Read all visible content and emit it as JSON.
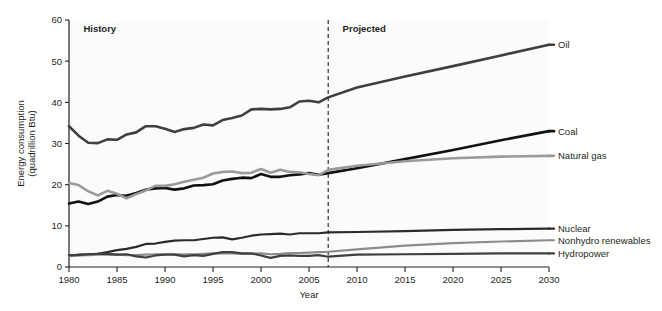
{
  "chart_data": {
    "type": "line",
    "title": "",
    "xlabel": "Year",
    "ylabel": "Energy consumption (quadrillion Btu)",
    "ylabel_line1": "Energy consumption",
    "ylabel_line2": "(quadrillion Btu)",
    "xlim": [
      1980,
      2030
    ],
    "ylim": [
      0,
      60
    ],
    "grid": false,
    "legend_position": "right-inline",
    "xticks": [
      1980,
      1985,
      1990,
      1995,
      2000,
      2005,
      2010,
      2015,
      2020,
      2025,
      2030
    ],
    "xtick_labels": [
      "1980",
      "1985",
      "1990",
      "1995",
      "2000",
      "2005",
      "2010",
      "2015",
      "2020",
      "2025",
      "2030"
    ],
    "yticks": [
      0,
      10,
      20,
      30,
      40,
      50,
      60
    ],
    "ytick_labels": [
      "0",
      "10",
      "20",
      "30",
      "40",
      "50",
      "60"
    ],
    "annotations": [
      {
        "name": "history",
        "text": "History",
        "x": 1981.5,
        "y": 57
      },
      {
        "name": "projected",
        "text": "Projected",
        "x": 2008.5,
        "y": 57
      }
    ],
    "divider": {
      "x": 2007,
      "style": "dashed",
      "label_left": "History",
      "label_right": "Projected"
    },
    "x": [
      1980,
      1981,
      1982,
      1983,
      1984,
      1985,
      1986,
      1987,
      1988,
      1989,
      1990,
      1991,
      1992,
      1993,
      1994,
      1995,
      1996,
      1997,
      1998,
      1999,
      2000,
      2001,
      2002,
      2003,
      2004,
      2005,
      2006,
      2007,
      2010,
      2015,
      2020,
      2025,
      2030
    ],
    "series": [
      {
        "name": "Oil",
        "color": "#3f3f3f",
        "width": 2.6,
        "label": "Oil",
        "label_value": 54,
        "values": [
          34.2,
          31.9,
          30.2,
          30.1,
          31.0,
          30.9,
          32.2,
          32.7,
          34.2,
          34.2,
          33.6,
          32.8,
          33.5,
          33.8,
          34.6,
          34.4,
          35.7,
          36.2,
          36.8,
          38.3,
          38.4,
          38.3,
          38.4,
          38.8,
          40.2,
          40.4,
          40.0,
          41.2,
          43.6,
          46.3,
          48.8,
          51.4,
          54.0
        ]
      },
      {
        "name": "Coal",
        "color": "#111111",
        "width": 2.6,
        "label": "Coal",
        "label_value": 33,
        "values": [
          15.4,
          15.9,
          15.3,
          15.9,
          17.1,
          17.5,
          17.3,
          18.0,
          18.8,
          19.1,
          19.2,
          18.8,
          19.1,
          19.8,
          19.9,
          20.1,
          21.0,
          21.4,
          21.7,
          21.6,
          22.6,
          21.9,
          21.9,
          22.3,
          22.5,
          22.8,
          22.4,
          22.8,
          24.0,
          26.2,
          28.4,
          30.8,
          33.0
        ]
      },
      {
        "name": "Natural gas",
        "color": "#9a9a9a",
        "width": 2.6,
        "label": "Natural gas",
        "label_value": 27,
        "values": [
          20.4,
          19.9,
          18.4,
          17.4,
          18.5,
          17.8,
          16.7,
          17.7,
          18.6,
          19.7,
          19.7,
          20.1,
          20.7,
          21.2,
          21.7,
          22.7,
          23.1,
          23.2,
          22.8,
          22.9,
          23.8,
          22.9,
          23.6,
          23.1,
          23.0,
          22.6,
          22.3,
          23.6,
          24.6,
          25.7,
          26.4,
          26.8,
          27.0
        ]
      },
      {
        "name": "Nuclear",
        "color": "#2b2b2b",
        "width": 2.2,
        "label": "Nuclear",
        "label_value": 9.3,
        "values": [
          2.7,
          3.0,
          3.1,
          3.2,
          3.6,
          4.1,
          4.4,
          4.9,
          5.6,
          5.7,
          6.1,
          6.4,
          6.5,
          6.5,
          6.8,
          7.1,
          7.2,
          6.7,
          7.1,
          7.6,
          7.9,
          8.0,
          8.1,
          7.9,
          8.2,
          8.2,
          8.2,
          8.4,
          8.5,
          8.7,
          9.0,
          9.2,
          9.3
        ]
      },
      {
        "name": "Nonhydro renewables",
        "color": "#8c8c8c",
        "width": 2.2,
        "label": "Nonhydro renewables",
        "label_value": 6.5,
        "values": [
          2.7,
          2.8,
          2.9,
          3.0,
          3.0,
          3.0,
          2.9,
          2.9,
          3.0,
          3.1,
          3.1,
          3.1,
          3.1,
          3.1,
          3.2,
          3.3,
          3.3,
          3.3,
          3.2,
          3.2,
          3.3,
          3.1,
          3.2,
          3.4,
          3.4,
          3.5,
          3.6,
          3.7,
          4.3,
          5.2,
          5.8,
          6.2,
          6.5
        ]
      },
      {
        "name": "Hydropower",
        "color": "#3f3f3f",
        "width": 2.2,
        "label": "Hydropower",
        "label_value": 3.3,
        "values": [
          2.9,
          2.9,
          3.1,
          3.2,
          3.2,
          3.0,
          3.1,
          2.6,
          2.3,
          2.8,
          3.0,
          3.0,
          2.6,
          2.9,
          2.7,
          3.2,
          3.6,
          3.6,
          3.3,
          3.3,
          2.8,
          2.2,
          2.7,
          2.8,
          2.7,
          2.7,
          2.9,
          2.5,
          3.0,
          3.1,
          3.2,
          3.3,
          3.3
        ]
      }
    ]
  }
}
